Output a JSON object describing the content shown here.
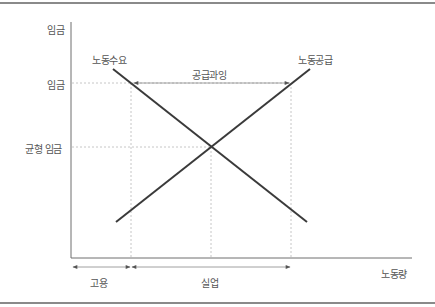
{
  "diagram": {
    "type": "labor-market-supply-demand",
    "y_axis_label": "임금",
    "x_axis_label": "노동량",
    "y_ticks": {
      "wage": "임금",
      "equilibrium_wage": "균형 임금"
    },
    "curves": {
      "demand": "노동수요",
      "supply": "노동공급"
    },
    "annotations": {
      "surplus": "공급과잉",
      "employment": "고용",
      "unemployment": "실업"
    },
    "colors": {
      "curve": "#3a3a3a",
      "axis": "#6e6e6e",
      "guide": "#b5b5b5",
      "text": "#555555",
      "frame": "#8a8a8a"
    }
  }
}
